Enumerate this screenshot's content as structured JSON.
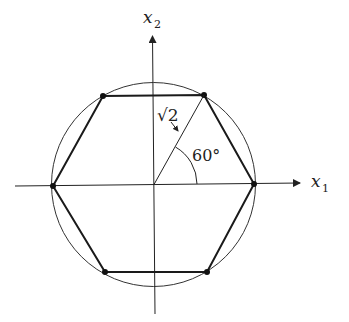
{
  "diagram": {
    "axes": {
      "x_label": "x",
      "x_subscript": "1",
      "y_label": "x",
      "y_subscript": "2"
    },
    "annotations": {
      "radius_label": "√2",
      "angle_label": "60°"
    },
    "colors": {
      "stroke": "#222222",
      "background": "#ffffff"
    },
    "geometry": {
      "center": [
        153.5,
        184.5
      ],
      "circle_radius": 102,
      "hexagon_vertices": [
        [
          254,
          184
        ],
        [
          204,
          95
        ],
        [
          103,
          96
        ],
        [
          53,
          186
        ],
        [
          105,
          272
        ],
        [
          207,
          272
        ]
      ],
      "angle_arc_radius": 43,
      "x_axis": {
        "from": [
          15,
          186
        ],
        "to": [
          302,
          183
        ]
      },
      "y_axis": {
        "from": [
          155,
          314
        ],
        "to": [
          152,
          34
        ]
      }
    }
  }
}
